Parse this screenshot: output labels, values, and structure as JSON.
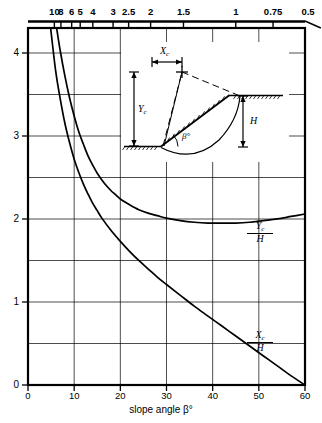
{
  "chart_data": {
    "type": "line",
    "title": "",
    "xlabel": "slope angle β°",
    "ylabel": "",
    "xlim": [
      0,
      60
    ],
    "ylim": [
      0,
      4.3
    ],
    "grid": true,
    "legend_position": "inline-right",
    "x_ticks": [
      0,
      10,
      20,
      30,
      40,
      50,
      60
    ],
    "x_tick_labels": [
      "0",
      "10",
      "20",
      "30",
      "40",
      "50",
      "60"
    ],
    "y_ticks": [
      0,
      1,
      2,
      3,
      4
    ],
    "y_tick_labels": [
      "0",
      "1",
      "2",
      "3",
      "4"
    ],
    "y_minor_ticks": [
      0.5,
      1.5,
      2.5,
      3.5
    ],
    "top_axis": {
      "label": "",
      "tick_labels": [
        "10",
        "8",
        "6",
        "5",
        "4",
        "3",
        "2.5",
        "2",
        "1.5",
        "1",
        "0.75",
        "0.5"
      ],
      "tick_values": [
        10,
        8,
        6,
        5,
        4,
        3,
        2.5,
        2,
        1.5,
        1,
        0.75,
        0.5
      ],
      "tick_angles": [
        5.71,
        7.13,
        9.46,
        11.31,
        14.04,
        18.43,
        21.8,
        26.57,
        33.69,
        45.0,
        53.13,
        63.43
      ]
    },
    "series": [
      {
        "name": "Yc/H",
        "label_num": "Y",
        "label_sub": "c",
        "label_den": "H",
        "x": [
          6.2,
          7,
          8,
          9,
          10,
          11,
          12,
          13,
          14,
          15,
          16,
          17,
          18,
          19,
          20,
          22,
          24,
          26,
          28,
          30,
          33,
          36,
          39,
          42,
          45,
          48,
          51,
          54,
          57,
          60
        ],
        "y": [
          4.3,
          4.02,
          3.72,
          3.46,
          3.24,
          3.05,
          2.9,
          2.76,
          2.65,
          2.55,
          2.47,
          2.4,
          2.34,
          2.29,
          2.24,
          2.17,
          2.11,
          2.07,
          2.04,
          2.01,
          1.98,
          1.96,
          1.95,
          1.95,
          1.95,
          1.96,
          1.98,
          2.0,
          2.03,
          2.06
        ]
      },
      {
        "name": "Xc/H",
        "label_num": "X",
        "label_sub": "c",
        "label_den": "H",
        "x": [
          4.9,
          6,
          7,
          8,
          9,
          10,
          11,
          12,
          13,
          14,
          15,
          16,
          18,
          20,
          22,
          24,
          26,
          28,
          30,
          33,
          36,
          39,
          42,
          45,
          48,
          51,
          54,
          57,
          60
        ],
        "y": [
          4.3,
          3.78,
          3.44,
          3.15,
          2.92,
          2.72,
          2.56,
          2.42,
          2.3,
          2.19,
          2.1,
          2.01,
          1.86,
          1.73,
          1.61,
          1.5,
          1.4,
          1.3,
          1.21,
          1.08,
          0.95,
          0.83,
          0.71,
          0.59,
          0.47,
          0.35,
          0.23,
          0.11,
          0.0
        ]
      }
    ],
    "inset": {
      "name": "slope-stability-diagram",
      "labels": [
        {
          "key": "Xc",
          "num": "X",
          "sub": "c"
        },
        {
          "key": "Yc",
          "num": "Y",
          "sub": "c"
        },
        {
          "key": "H",
          "num": "H",
          "sub": ""
        },
        {
          "key": "beta",
          "num": "β°",
          "sub": ""
        }
      ]
    }
  }
}
